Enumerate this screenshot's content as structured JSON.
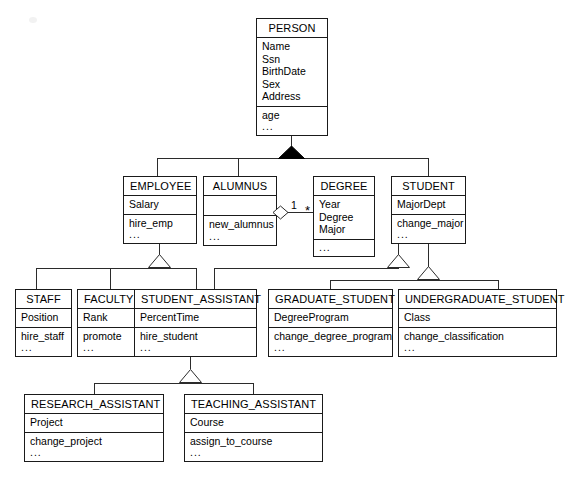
{
  "diagram": {
    "notation": "UML",
    "classes": {
      "person": {
        "name": "PERSON",
        "attributes": [
          "Name",
          "Ssn",
          "BirthDate",
          "Sex",
          "Address"
        ],
        "operations": [
          "age"
        ],
        "ellipsis": "..."
      },
      "employee": {
        "name": "EMPLOYEE",
        "attributes": [
          "Salary"
        ],
        "operations": [
          "hire_emp"
        ],
        "ellipsis": "..."
      },
      "alumnus": {
        "name": "ALUMNUS",
        "attributes": [],
        "operations": [
          "new_alumnus"
        ],
        "ellipsis": "..."
      },
      "degree": {
        "name": "DEGREE",
        "attributes": [
          "Year",
          "Degree",
          "Major"
        ],
        "operations": [],
        "ellipsis": "..."
      },
      "student": {
        "name": "STUDENT",
        "attributes": [
          "MajorDept"
        ],
        "operations": [
          "change_major"
        ],
        "ellipsis": "..."
      },
      "staff": {
        "name": "STAFF",
        "attributes": [
          "Position"
        ],
        "operations": [
          "hire_staff"
        ],
        "ellipsis": "..."
      },
      "faculty": {
        "name": "FACULTY",
        "attributes": [
          "Rank"
        ],
        "operations": [
          "promote"
        ],
        "ellipsis": "..."
      },
      "student_assistant": {
        "name": "STUDENT_ASSISTANT",
        "attributes": [
          "PercentTime"
        ],
        "operations": [
          "hire_student"
        ],
        "ellipsis": "..."
      },
      "graduate_student": {
        "name": "GRADUATE_STUDENT",
        "attributes": [
          "DegreeProgram"
        ],
        "operations": [
          "change_degree_program"
        ],
        "ellipsis": "..."
      },
      "undergraduate_student": {
        "name": "UNDERGRADUATE_STUDENT",
        "attributes": [
          "Class"
        ],
        "operations": [
          "change_classification"
        ],
        "ellipsis": "..."
      },
      "research_assistant": {
        "name": "RESEARCH_ASSISTANT",
        "attributes": [
          "Project"
        ],
        "operations": [
          "change_project"
        ],
        "ellipsis": "..."
      },
      "teaching_assistant": {
        "name": "TEACHING_ASSISTANT",
        "attributes": [
          "Course"
        ],
        "operations": [
          "assign_to_course"
        ],
        "ellipsis": "..."
      }
    },
    "relationships": {
      "person_specialization": {
        "type": "generalization",
        "marker": "filled-triangle",
        "superclass": "PERSON",
        "subclasses": [
          "EMPLOYEE",
          "ALUMNUS",
          "STUDENT"
        ]
      },
      "employee_specialization": {
        "type": "generalization",
        "marker": "hollow-triangle",
        "superclass": "EMPLOYEE",
        "subclasses": [
          "STAFF",
          "FACULTY",
          "STUDENT_ASSISTANT"
        ]
      },
      "student_assistant_generalization": {
        "type": "generalization",
        "marker": "hollow-triangle",
        "superclass": "STUDENT",
        "subclasses": [
          "STUDENT_ASSISTANT"
        ]
      },
      "student_specialization": {
        "type": "generalization",
        "marker": "hollow-triangle",
        "superclass": "STUDENT",
        "subclasses": [
          "GRADUATE_STUDENT",
          "UNDERGRADUATE_STUDENT"
        ]
      },
      "assistant_specialization": {
        "type": "generalization",
        "marker": "hollow-triangle",
        "superclass": "STUDENT_ASSISTANT",
        "subclasses": [
          "RESEARCH_ASSISTANT",
          "TEACHING_ASSISTANT"
        ]
      },
      "alumnus_degree": {
        "type": "aggregation",
        "marker": "hollow-diamond",
        "whole": "ALUMNUS",
        "part": "DEGREE",
        "multiplicity_whole": "1",
        "multiplicity_part": "*"
      }
    },
    "colors": {
      "line": "#2b2b2b",
      "border": "#1a1a1a",
      "fill": "#ffffff",
      "text": "#000000",
      "filled_marker": "#000000"
    }
  }
}
